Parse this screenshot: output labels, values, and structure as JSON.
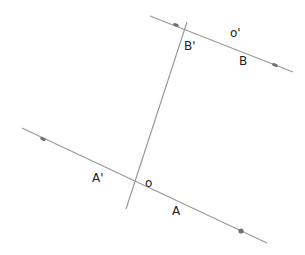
{
  "diagram": {
    "colors": {
      "line": "#9a9a9a",
      "point": "#707070",
      "text": "#222222"
    },
    "lines": [
      {
        "id": "line-b",
        "x1": 150,
        "y1": 16,
        "x2": 293,
        "y2": 72
      },
      {
        "id": "line-a",
        "x1": 22,
        "y1": 128,
        "x2": 267,
        "y2": 243
      },
      {
        "id": "transversal",
        "x1": 126,
        "y1": 209,
        "x2": 187,
        "y2": 22
      }
    ],
    "points": [
      {
        "id": "pt-b-left",
        "x": 176,
        "y": 25
      },
      {
        "id": "pt-b-right",
        "x": 275,
        "y": 65
      },
      {
        "id": "pt-a-left",
        "x": 43,
        "y": 139
      },
      {
        "id": "pt-a-right",
        "x": 241,
        "y": 231
      }
    ],
    "labels": {
      "b_prime": "B'",
      "o_prime": "o'",
      "b": "B",
      "a_prime": "A'",
      "o": "o",
      "a": "A"
    }
  }
}
